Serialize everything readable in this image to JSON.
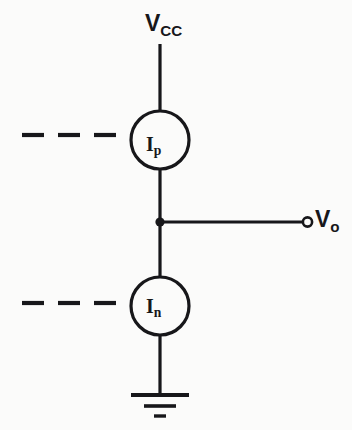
{
  "diagram": {
    "background_color": "#fbfbfa",
    "ink_color": "#17171a",
    "labels": {
      "supply": {
        "symbol": "V",
        "subscript": "CC",
        "full": "Vcc"
      },
      "output": {
        "symbol": "V",
        "subscript": "o",
        "full": "Vo"
      },
      "source_top": {
        "symbol": "I",
        "subscript": "p",
        "full": "Ip"
      },
      "source_bottom": {
        "symbol": "I",
        "subscript": "n",
        "full": "In"
      }
    },
    "components": [
      {
        "name": "supply-rail",
        "type": "wire"
      },
      {
        "name": "current-source-p",
        "type": "current-source",
        "label": "Ip"
      },
      {
        "name": "output-node",
        "type": "junction"
      },
      {
        "name": "output-wire",
        "type": "wire"
      },
      {
        "name": "output-terminal",
        "type": "terminal",
        "label": "Vo"
      },
      {
        "name": "current-source-n",
        "type": "current-source",
        "label": "In"
      },
      {
        "name": "ground",
        "type": "ground"
      },
      {
        "name": "control-line-top",
        "type": "dashed-line"
      },
      {
        "name": "control-line-bottom",
        "type": "dashed-line"
      }
    ]
  }
}
